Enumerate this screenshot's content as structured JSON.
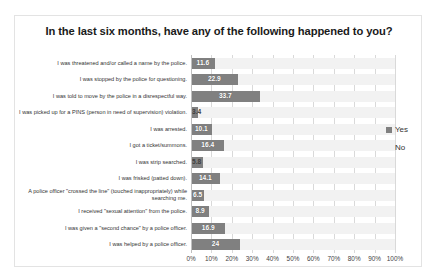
{
  "chart_data": {
    "type": "bar",
    "orientation": "horizontal",
    "stacked": true,
    "title": "In  the last six months, have any of the following happened to you?",
    "xlabel": "",
    "ylabel": "",
    "xlim": [
      0,
      100
    ],
    "grid": true,
    "legend_position": "right",
    "categories": [
      "I was threatened and/or called a name by the police.",
      "I was stopped by the police for questioning.",
      "I was told to move by the police in a disrespectful way.",
      "I was picked up for a PINS (person in need of supervision) violation.",
      "I was arrested.",
      "I got a ticket/summons.",
      "I was strip searched.",
      "I was frisked (patted down).",
      "A police officer \"crossed the line\" (touched inappropriately) while searching me.",
      "I received \"sexual attention\" from the police.",
      "I was given a \"second chance\" by a police officer.",
      "I was helped by a police officer."
    ],
    "series": [
      {
        "name": "Yes",
        "color": "#808080",
        "values": [
          11.6,
          22.9,
          33.7,
          3.4,
          10.1,
          16.4,
          5.8,
          14.1,
          6.5,
          8.9,
          16.9,
          24
        ]
      },
      {
        "name": "No",
        "color": "#f2f2f2",
        "values": [
          88.4,
          77.1,
          66.3,
          96.6,
          89.9,
          83.6,
          94.2,
          85.9,
          93.5,
          91.1,
          83.1,
          76
        ]
      }
    ],
    "data_labels": [
      "11.6",
      "22.9",
      "33.7",
      "3.4",
      "10.1",
      "16.4",
      "5.8",
      "14.1",
      "6.5",
      "8.9",
      "16.9",
      "24"
    ],
    "xticks": [
      0,
      10,
      20,
      30,
      40,
      50,
      60,
      70,
      80,
      90,
      100
    ],
    "xtick_labels": [
      "0%",
      "10%",
      "20%",
      "30%",
      "40%",
      "50%",
      "60%",
      "70%",
      "80%",
      "90%",
      "100%"
    ]
  },
  "legend": {
    "items": [
      {
        "label": "Yes"
      },
      {
        "label": "No"
      }
    ]
  }
}
